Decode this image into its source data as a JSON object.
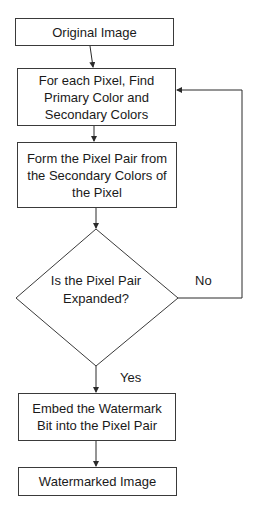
{
  "diagram": {
    "type": "flowchart",
    "nodes": [
      {
        "id": "original",
        "shape": "rect",
        "label": "Original Image"
      },
      {
        "id": "find_colors",
        "shape": "rect",
        "label": "For each Pixel, Find Primary Color and Secondary Colors"
      },
      {
        "id": "form_pair",
        "shape": "rect",
        "label": "Form the Pixel Pair from the Secondary Colors of the Pixel"
      },
      {
        "id": "decision",
        "shape": "diamond",
        "label": "Is the Pixel Pair Expanded?"
      },
      {
        "id": "embed",
        "shape": "rect",
        "label": "Embed the Watermark Bit into the Pixel Pair"
      },
      {
        "id": "output",
        "shape": "rect",
        "label": "Watermarked Image"
      }
    ],
    "edges": [
      {
        "from": "original",
        "to": "find_colors",
        "label": ""
      },
      {
        "from": "find_colors",
        "to": "form_pair",
        "label": ""
      },
      {
        "from": "form_pair",
        "to": "decision",
        "label": ""
      },
      {
        "from": "decision",
        "to": "find_colors",
        "label": "No"
      },
      {
        "from": "decision",
        "to": "embed",
        "label": "Yes"
      },
      {
        "from": "embed",
        "to": "output",
        "label": ""
      }
    ],
    "edge_labels": {
      "no": "No",
      "yes": "Yes"
    },
    "colors": {
      "stroke": "#3a3a3a",
      "fill": "#ffffff",
      "text": "#1a1a1a"
    }
  }
}
